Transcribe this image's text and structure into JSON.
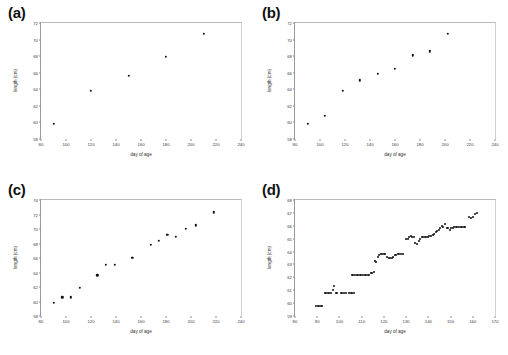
{
  "figure": {
    "caption": "",
    "panels": [
      {
        "tag": "(a)"
      },
      {
        "tag": "(b)"
      },
      {
        "tag": "(c)"
      },
      {
        "tag": "(d)"
      }
    ]
  },
  "chart_data": [
    {
      "type": "scatter",
      "panel": "(a)",
      "title": "",
      "xlabel": "day of age",
      "ylabel": "length (cm)",
      "xlim": [
        80,
        240
      ],
      "ylim": [
        58,
        72
      ],
      "xticks": [
        80,
        100,
        120,
        140,
        160,
        180,
        200,
        220,
        240
      ],
      "yticks": [
        58,
        60,
        62,
        64,
        66,
        68,
        70,
        72
      ],
      "grid": false,
      "legend": null,
      "marker": "filled-circle",
      "marker_color": "#111111",
      "points": [
        [
          90,
          59.8
        ],
        [
          120,
          63.8
        ],
        [
          150,
          65.6
        ],
        [
          180,
          67.9
        ],
        [
          210,
          70.7
        ]
      ]
    },
    {
      "type": "scatter",
      "panel": "(b)",
      "title": "",
      "xlabel": "day of age",
      "ylabel": "length (cm)",
      "xlim": [
        80,
        240
      ],
      "ylim": [
        58,
        72
      ],
      "xticks": [
        80,
        100,
        120,
        140,
        160,
        180,
        200,
        220,
        240
      ],
      "yticks": [
        58,
        60,
        62,
        64,
        66,
        68,
        70,
        72
      ],
      "grid": false,
      "legend": null,
      "marker": "filled-circle",
      "marker_color": "#111111",
      "points": [
        [
          90,
          59.8
        ],
        [
          104,
          60.8
        ],
        [
          118,
          63.8
        ],
        [
          132,
          65.1
        ],
        [
          146,
          65.9
        ],
        [
          160,
          66.5
        ],
        [
          174,
          68.1
        ],
        [
          188,
          68.6
        ],
        [
          202,
          70.7
        ]
      ]
    },
    {
      "type": "scatter",
      "panel": "(c)",
      "title": "",
      "xlabel": "day of age",
      "ylabel": "length (cm)",
      "xlim": [
        80,
        240
      ],
      "ylim": [
        58,
        74
      ],
      "xticks": [
        80,
        100,
        120,
        140,
        160,
        180,
        200,
        220,
        240
      ],
      "yticks": [
        58,
        60,
        62,
        64,
        66,
        68,
        70,
        72,
        74
      ],
      "grid": false,
      "legend": null,
      "marker": "filled-circle",
      "marker_color": "#111111",
      "points": [
        [
          90,
          59.8
        ],
        [
          97,
          60.6
        ],
        [
          104,
          60.6
        ],
        [
          111,
          61.9
        ],
        [
          125,
          63.6
        ],
        [
          132,
          65.1
        ],
        [
          139,
          65.1
        ],
        [
          153,
          66.0
        ],
        [
          168,
          67.8
        ],
        [
          174,
          68.4
        ],
        [
          181,
          69.2
        ],
        [
          188,
          68.9
        ],
        [
          196,
          70.0
        ],
        [
          204,
          70.5
        ],
        [
          218,
          72.3
        ]
      ]
    },
    {
      "type": "scatter",
      "panel": "(d)",
      "title": "",
      "xlabel": "day of age",
      "ylabel": "length (cm)",
      "xlim": [
        80,
        170
      ],
      "ylim": [
        59,
        68
      ],
      "xticks": [
        80,
        90,
        100,
        110,
        120,
        130,
        140,
        150,
        160,
        170
      ],
      "yticks": [
        59,
        60,
        61,
        62,
        63,
        64,
        65,
        66,
        67,
        68
      ],
      "grid": false,
      "legend": null,
      "marker": "filled-circle",
      "marker_color": "#111111",
      "points": [
        [
          89.5,
          59.8
        ],
        [
          90.2,
          59.8
        ],
        [
          90.9,
          59.8
        ],
        [
          91.6,
          59.8
        ],
        [
          92.3,
          59.8
        ],
        [
          93.4,
          60.8
        ],
        [
          94.1,
          60.8
        ],
        [
          94.8,
          60.8
        ],
        [
          95.5,
          60.8
        ],
        [
          96.2,
          60.8
        ],
        [
          97.0,
          61.0
        ],
        [
          97.6,
          61.3
        ],
        [
          98.3,
          60.8
        ],
        [
          99.0,
          60.8
        ],
        [
          100.5,
          60.8
        ],
        [
          101.3,
          60.8
        ],
        [
          102.0,
          60.8
        ],
        [
          102.8,
          60.8
        ],
        [
          104.4,
          60.8
        ],
        [
          105.1,
          60.8
        ],
        [
          105.8,
          60.8
        ],
        [
          106.5,
          60.8
        ],
        [
          105.5,
          62.2
        ],
        [
          106.3,
          62.2
        ],
        [
          107.0,
          62.2
        ],
        [
          107.8,
          62.2
        ],
        [
          108.5,
          62.2
        ],
        [
          109.2,
          62.2
        ],
        [
          109.9,
          62.2
        ],
        [
          110.6,
          62.2
        ],
        [
          111.3,
          62.2
        ],
        [
          112.0,
          62.2
        ],
        [
          112.7,
          62.2
        ],
        [
          113.4,
          62.2
        ],
        [
          114.1,
          62.3
        ],
        [
          114.8,
          62.3
        ],
        [
          115.4,
          62.4
        ],
        [
          116.0,
          63.3
        ],
        [
          116.6,
          63.2
        ],
        [
          117.2,
          63.6
        ],
        [
          117.9,
          63.7
        ],
        [
          118.6,
          63.8
        ],
        [
          119.3,
          63.8
        ],
        [
          120.0,
          63.8
        ],
        [
          120.7,
          63.8
        ],
        [
          121.4,
          63.6
        ],
        [
          122.1,
          63.5
        ],
        [
          122.8,
          63.5
        ],
        [
          123.5,
          63.5
        ],
        [
          124.2,
          63.6
        ],
        [
          124.9,
          63.7
        ],
        [
          125.6,
          63.7
        ],
        [
          126.3,
          63.8
        ],
        [
          127.0,
          63.8
        ],
        [
          127.7,
          63.8
        ],
        [
          128.4,
          63.8
        ],
        [
          130.0,
          65.0
        ],
        [
          130.7,
          65.0
        ],
        [
          131.4,
          65.1
        ],
        [
          132.1,
          65.2
        ],
        [
          132.8,
          65.1
        ],
        [
          133.5,
          65.1
        ],
        [
          134.2,
          64.7
        ],
        [
          134.9,
          64.6
        ],
        [
          135.6,
          64.8
        ],
        [
          136.3,
          65.0
        ],
        [
          137.0,
          65.1
        ],
        [
          137.7,
          65.1
        ],
        [
          138.4,
          65.1
        ],
        [
          139.1,
          65.1
        ],
        [
          139.8,
          65.1
        ],
        [
          140.5,
          65.2
        ],
        [
          141.2,
          65.2
        ],
        [
          141.9,
          65.3
        ],
        [
          142.6,
          65.4
        ],
        [
          143.3,
          65.5
        ],
        [
          144.0,
          65.6
        ],
        [
          144.7,
          65.7
        ],
        [
          145.4,
          65.8
        ],
        [
          146.1,
          66.0
        ],
        [
          146.8,
          65.9
        ],
        [
          147.5,
          66.1
        ],
        [
          148.2,
          65.8
        ],
        [
          148.9,
          65.8
        ],
        [
          149.6,
          65.7
        ],
        [
          150.3,
          65.8
        ],
        [
          151.0,
          65.8
        ],
        [
          151.7,
          65.9
        ],
        [
          152.4,
          65.9
        ],
        [
          153.1,
          65.9
        ],
        [
          153.8,
          65.9
        ],
        [
          154.5,
          65.9
        ],
        [
          155.2,
          65.9
        ],
        [
          155.9,
          65.9
        ],
        [
          156.6,
          65.9
        ],
        [
          158.5,
          66.7
        ],
        [
          159.2,
          66.6
        ],
        [
          159.9,
          66.7
        ],
        [
          161.0,
          66.9
        ],
        [
          161.7,
          67.0
        ]
      ]
    }
  ]
}
